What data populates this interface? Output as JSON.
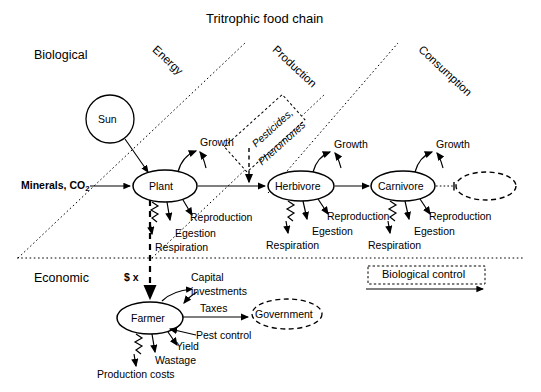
{
  "title": "Tritrophic food chain",
  "domains": {
    "biological": "Biological",
    "economic": "Economic"
  },
  "bands": [
    {
      "name": "energy",
      "label": "Energy"
    },
    {
      "name": "production",
      "label": "Production"
    },
    {
      "name": "consumption",
      "label": "Consumption"
    }
  ],
  "nodes": {
    "sun": "Sun",
    "plant": "Plant",
    "herbivore": "Herbivore",
    "carnivore": "Carnivore",
    "farmer": "Farmer",
    "government": "Government",
    "unnamed_top_predator": ""
  },
  "inputs": {
    "minerals": "Minerals, CO",
    "minerals_sub": "2",
    "money": "$ x"
  },
  "boxes": {
    "pesticides_line1": "Pesticides,",
    "pesticides_line2": "Pheromones",
    "biological_control": "Biological control"
  },
  "plant_flows": {
    "growth": "Growth",
    "reproduction": "Reproduction",
    "egestion": "Egestion",
    "respiration": "Respiration"
  },
  "herbivore_flows": {
    "growth": "Growth",
    "reproduction": "Reproduction",
    "egestion": "Egestion",
    "respiration": "Respiration"
  },
  "carnivore_flows": {
    "growth": "Growth",
    "reproduction": "Reproduction",
    "egestion": "Egestion",
    "respiration": "Respiration"
  },
  "farmer_flows": {
    "capital_line1": "Capital",
    "capital_line2": "investments",
    "taxes": "Taxes",
    "pest_control": "Pest control",
    "yield": "Yield",
    "wastage": "Wastage",
    "production_costs": "Production costs"
  },
  "colors": {
    "stroke": "#000000",
    "background": "#ffffff",
    "text": "#000000"
  }
}
